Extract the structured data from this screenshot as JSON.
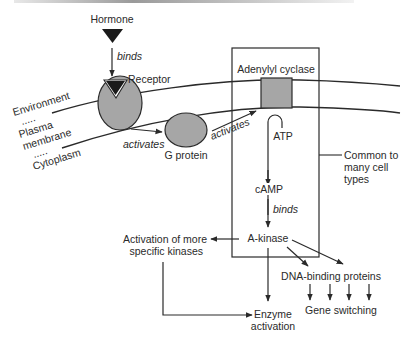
{
  "diagram": {
    "colors": {
      "line": "#2a2a2a",
      "protein_fill": "#a6a6a6",
      "hormone_fill": "#1a1a1a",
      "background": "#ffffff"
    },
    "labels": {
      "hormone": "Hormone",
      "binds_1": "binds",
      "receptor": "Receptor",
      "environment": "Environment",
      "plasma": "Plasma",
      "membrane": "membrane",
      "cytoplasm": "Cytoplasm",
      "dots": ".....",
      "activates_1": "activates",
      "g_protein": "G protein",
      "activates_2": "activates",
      "adenylyl_cyclase": "Adenylyl cyclase",
      "atp": "ATP",
      "common_line1": "Common to",
      "common_line2": "many cell",
      "common_line3": "types",
      "camp": "cAMP",
      "binds_2": "binds",
      "a_kinase": "A-kinase",
      "more_kinases_line1": "Activation of more",
      "more_kinases_line2": "specific kinases",
      "dna_binding": "DNA-binding proteins",
      "gene_switching": "Gene switching",
      "enzyme_line1": "Enzyme",
      "enzyme_line2": "activation"
    },
    "nodes": [
      {
        "id": "hormone",
        "shape": "triangle"
      },
      {
        "id": "receptor",
        "shape": "ellipse-notched"
      },
      {
        "id": "g_protein",
        "shape": "ellipse"
      },
      {
        "id": "adenylyl_cyclase",
        "shape": "square"
      },
      {
        "id": "camp",
        "shape": "text"
      },
      {
        "id": "a_kinase",
        "shape": "text"
      },
      {
        "id": "more_kinases",
        "shape": "text"
      },
      {
        "id": "dna_binding",
        "shape": "text"
      },
      {
        "id": "gene_switching",
        "shape": "text"
      },
      {
        "id": "enzyme_activation",
        "shape": "text"
      }
    ],
    "edges": [
      {
        "from": "hormone",
        "to": "receptor",
        "label": "binds"
      },
      {
        "from": "receptor",
        "to": "g_protein",
        "label": "activates"
      },
      {
        "from": "g_protein",
        "to": "adenylyl_cyclase",
        "label": "activates"
      },
      {
        "from": "adenylyl_cyclase",
        "to": "camp",
        "label": "ATP"
      },
      {
        "from": "camp",
        "to": "a_kinase",
        "label": "binds"
      },
      {
        "from": "a_kinase",
        "to": "more_kinases",
        "label": ""
      },
      {
        "from": "a_kinase",
        "to": "dna_binding",
        "label": ""
      },
      {
        "from": "a_kinase",
        "to": "enzyme_activation",
        "label": ""
      },
      {
        "from": "more_kinases",
        "to": "enzyme_activation",
        "label": ""
      },
      {
        "from": "dna_binding",
        "to": "gene_switching",
        "label": ""
      }
    ]
  }
}
